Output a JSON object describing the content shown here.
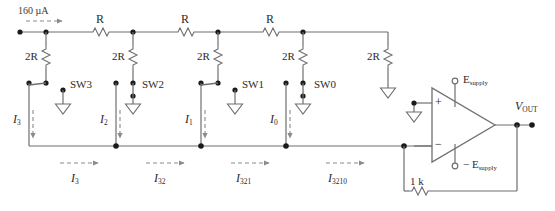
{
  "diagram": {
    "type": "schematic",
    "colors": {
      "wire": "#6f6f6f",
      "node": "#1a1a1a",
      "text": "#2b2b2b",
      "arrow": "#8a8a8a",
      "background": "#ffffff"
    }
  },
  "source": {
    "current_label": "160",
    "current_units": "µA",
    "arrow": "dashed-right-arrow"
  },
  "series_resistors": [
    {
      "label": "R",
      "name": "series-resistor-r1"
    },
    {
      "label": "R",
      "name": "series-resistor-r2"
    },
    {
      "label": "R",
      "name": "series-resistor-r3"
    }
  ],
  "shunt_resistors": [
    {
      "label": "2R",
      "name": "shunt-resistor-2r-bit3"
    },
    {
      "label": "2R",
      "name": "shunt-resistor-2r-bit2"
    },
    {
      "label": "2R",
      "name": "shunt-resistor-2r-bit1"
    },
    {
      "label": "2R",
      "name": "shunt-resistor-2r-bit0"
    },
    {
      "label": "2R",
      "name": "shunt-resistor-2r-term"
    }
  ],
  "switches": [
    {
      "label": "SW3",
      "position": "left-to-bus"
    },
    {
      "label": "SW2",
      "position": "right-to-ground"
    },
    {
      "label": "SW1",
      "position": "left-to-bus"
    },
    {
      "label": "SW0",
      "position": "right-to-ground"
    }
  ],
  "branch_currents": [
    {
      "symbol": "I",
      "subscript": "3"
    },
    {
      "symbol": "I",
      "subscript": "2"
    },
    {
      "symbol": "I",
      "subscript": "1"
    },
    {
      "symbol": "I",
      "subscript": "0"
    }
  ],
  "bus_currents": [
    {
      "symbol": "I",
      "subscript": "3"
    },
    {
      "symbol": "I",
      "subscript": "32"
    },
    {
      "symbol": "I",
      "subscript": "321"
    },
    {
      "symbol": "I",
      "subscript": "3210"
    }
  ],
  "opamp": {
    "plus_label": "+",
    "minus_label": "−",
    "supply_positive": "E",
    "supply_positive_sub": "supply",
    "supply_negative_prefix": "− E",
    "supply_negative_sub": "supply",
    "feedback_resistor": "1 k",
    "output_label": "V",
    "output_sub": "OUT"
  },
  "ground_symbol": "triangle-ground"
}
